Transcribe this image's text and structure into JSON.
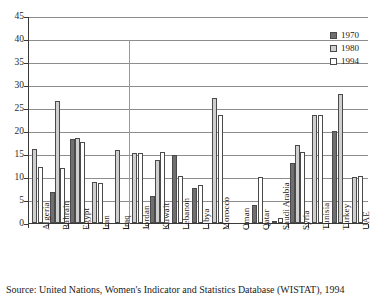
{
  "chart_data": {
    "type": "bar",
    "title": "",
    "xlabel": "",
    "ylabel": "",
    "ylim": [
      0,
      45
    ],
    "yticks": [
      0,
      5,
      10,
      15,
      20,
      25,
      30,
      35,
      40,
      45
    ],
    "grid": true,
    "legend_position": "right",
    "categories": [
      "Algeria",
      "Bahrain",
      "Egypt",
      "Iran",
      "Iraq",
      "Jordan",
      "Kuwait",
      "Lebanon",
      "Libya",
      "Morocco",
      "Oman",
      "Qatar",
      "Saudi Arabia",
      "Syria",
      "Tunisia",
      "Turkey",
      "UAE"
    ],
    "series": [
      {
        "name": "1970",
        "color": "#6f6f6f",
        "values": [
          null,
          6.7,
          18.2,
          null,
          null,
          null,
          5.9,
          14.8,
          7.7,
          null,
          null,
          4.0,
          0.3,
          13.0,
          null,
          20.0,
          null
        ]
      },
      {
        "name": "1980",
        "color": "#cfcfcf",
        "values": [
          16.1,
          26.5,
          18.4,
          9.0,
          15.8,
          15.3,
          13.7,
          null,
          null,
          27.2,
          null,
          null,
          null,
          17.0,
          23.5,
          28.0,
          10.0
        ]
      },
      {
        "name": "1994",
        "color": "#ffffff",
        "values": [
          12.2,
          12.0,
          17.7,
          8.7,
          null,
          15.3,
          15.5,
          10.2,
          8.3,
          23.5,
          null,
          10.0,
          1.0,
          15.5,
          23.5,
          null,
          10.2
        ]
      }
    ],
    "annotations": {
      "divider_after_category": "Iraq",
      "divider_top_value": 40
    }
  },
  "legend": {
    "items": [
      {
        "label": "1970",
        "swatch": "#6f6f6f"
      },
      {
        "label": "1980",
        "swatch": "#cfcfcf"
      },
      {
        "label": "1994",
        "swatch": "#ffffff"
      }
    ]
  },
  "source": {
    "text": "Source: United Nations, Women's Indicator and Statistics Database (WISTAT), 1994"
  }
}
